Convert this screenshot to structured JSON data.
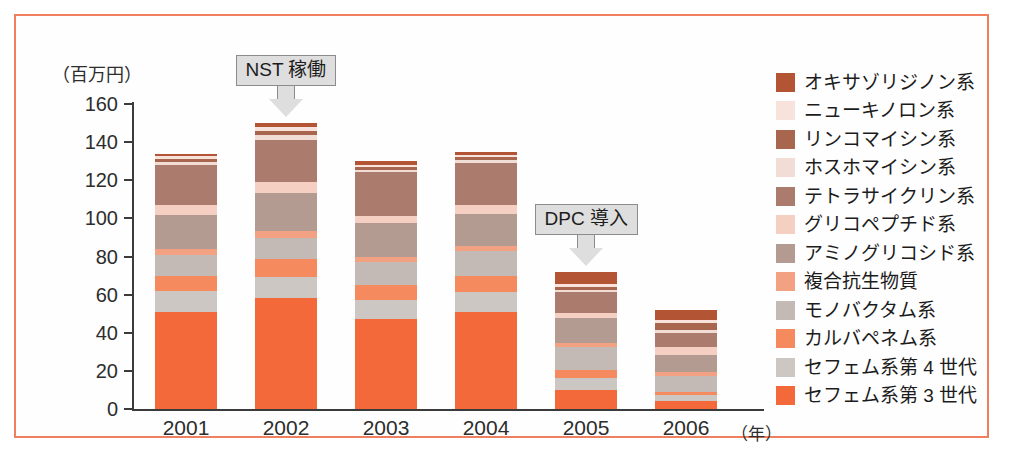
{
  "chart_data": {
    "type": "bar",
    "stacked": true,
    "title": "",
    "ylabel": "（百万円）",
    "xlabel": "（年）",
    "categories": [
      "2001",
      "2002",
      "2003",
      "2004",
      "2005",
      "2006"
    ],
    "ylim": [
      0,
      160
    ],
    "ytick_labels": [
      "160",
      "140",
      "120",
      "100",
      "80",
      "60",
      "40",
      "20",
      "0"
    ],
    "ytick_values": [
      160,
      140,
      120,
      100,
      80,
      60,
      40,
      20,
      0
    ],
    "grid": false,
    "legend_position": "right",
    "totals": [
      134,
      150,
      130,
      135,
      72,
      52
    ],
    "series": [
      {
        "name": "オキサゾリジノン系",
        "color": "#b35434",
        "values": [
          1.5,
          2.0,
          2.0,
          2.0,
          6.5,
          5.5
        ]
      },
      {
        "name": "ニューキノロン系",
        "color": "#f7e3dc",
        "values": [
          1.5,
          2.0,
          1.0,
          1.0,
          1.5,
          1.5
        ]
      },
      {
        "name": "リンコマイシン系",
        "color": "#a8664f",
        "values": [
          1.5,
          2.5,
          1.5,
          1.5,
          1.5,
          3.5
        ]
      },
      {
        "name": "ホスホマイシン系",
        "color": "#f2ddd6",
        "values": [
          1.5,
          2.5,
          1.0,
          1.5,
          1.0,
          1.5
        ]
      },
      {
        "name": "テトラサイクリン系",
        "color": "#ab7b6d",
        "values": [
          21.0,
          22.0,
          23.0,
          22.0,
          11.0,
          7.5
        ]
      },
      {
        "name": "グリコペプチド系",
        "color": "#f4cfc2",
        "values": [
          5.0,
          5.5,
          4.0,
          4.5,
          2.5,
          4.0
        ]
      },
      {
        "name": "アミノグリコシド系",
        "color": "#b39b92",
        "values": [
          18.0,
          20.0,
          18.0,
          17.0,
          13.5,
          9.0
        ]
      },
      {
        "name": "複合抗生物質",
        "color": "#f2a183",
        "values": [
          3.0,
          4.0,
          2.5,
          2.5,
          2.0,
          2.0
        ]
      },
      {
        "name": "モノバクタム系",
        "color": "#c4bab5",
        "values": [
          11.0,
          11.0,
          12.0,
          13.0,
          12.0,
          8.5
        ]
      },
      {
        "name": "カルバペネム系",
        "color": "#f58a5e",
        "values": [
          8.0,
          9.0,
          8.0,
          8.5,
          4.0,
          1.5
        ]
      },
      {
        "name": "セフェム系第 4 世代",
        "color": "#cdc7c4",
        "values": [
          11.0,
          11.5,
          10.0,
          10.5,
          6.5,
          3.5
        ]
      },
      {
        "name": "セフェム系第 3 世代",
        "color": "#f4693a",
        "values": [
          51.0,
          58.0,
          47.0,
          51.0,
          10.0,
          4.0
        ]
      }
    ],
    "annotations": [
      {
        "text": "NST 稼働",
        "target_category": "2002"
      },
      {
        "text": "DPC 導入",
        "target_category": "2005"
      }
    ]
  },
  "colors": {
    "frame_border": "#ef7f5e",
    "axis": "#3b3b3b",
    "text": "#2d2d2d",
    "callout_fill": "#dedede",
    "callout_stroke": "#8c8c8c"
  }
}
